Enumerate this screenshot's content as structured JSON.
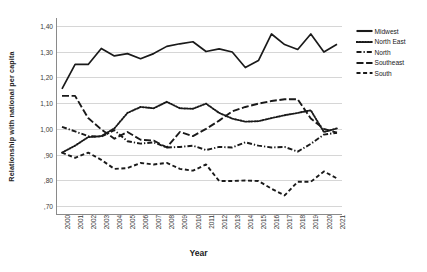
{
  "chart_data": {
    "type": "line",
    "title": "",
    "xlabel": "Year",
    "ylabel": "Relationship with national per capita",
    "grid": true,
    "legend_position": "right",
    "decimal_separator": ",",
    "x": [
      2000,
      2001,
      2002,
      2003,
      2004,
      2005,
      2006,
      2007,
      2008,
      2009,
      2010,
      2011,
      2012,
      2013,
      2014,
      2015,
      2016,
      2017,
      2018,
      2019,
      2020,
      2021
    ],
    "xtick_labels": [
      "2000",
      "2001",
      "2002",
      "2003",
      "2004",
      "2005",
      "2006",
      "2007",
      "2008",
      "2009",
      "2010",
      "2011",
      "2012",
      "2013",
      "2014",
      "2015",
      "2016",
      "2017",
      "2018",
      "2019",
      "2020",
      "2021"
    ],
    "ytick_labels": [
      "1,40",
      "1,30",
      "1,20",
      "1,10",
      "1,00",
      ",90",
      ",80",
      ",70"
    ],
    "ytick_values": [
      1.4,
      1.3,
      1.2,
      1.1,
      1.0,
      0.9,
      0.8,
      0.7
    ],
    "ylim": [
      0.67,
      1.43
    ],
    "series": [
      {
        "name": "Midwest",
        "style": "solid",
        "color": "#1a1a1a",
        "values": [
          1.155,
          1.25,
          1.25,
          1.312,
          1.283,
          1.292,
          1.272,
          1.292,
          1.32,
          1.33,
          1.338,
          1.3,
          1.31,
          1.298,
          1.238,
          1.265,
          1.368,
          1.327,
          1.308,
          1.368,
          1.298,
          1.328
        ]
      },
      {
        "name": "North East",
        "style": "dotted",
        "color": "#1a1a1a",
        "values": [
          0.908,
          0.935,
          0.968,
          0.972,
          1.002,
          1.062,
          1.085,
          1.08,
          1.105,
          1.08,
          1.078,
          1.098,
          1.062,
          1.04,
          1.028,
          1.03,
          1.042,
          1.053,
          1.062,
          1.072,
          0.988,
          1.002
        ]
      },
      {
        "name": "North",
        "style": "dashdot",
        "color": "#1a1a1a",
        "values": [
          1.008,
          0.99,
          0.972,
          0.97,
          0.995,
          0.952,
          0.943,
          0.948,
          0.928,
          0.93,
          0.935,
          0.918,
          0.93,
          0.928,
          0.948,
          0.935,
          0.928,
          0.93,
          0.912,
          0.942,
          0.978,
          0.985
        ]
      },
      {
        "name": "Southeast",
        "style": "longdash",
        "color": "#1a1a1a",
        "values": [
          1.128,
          1.128,
          1.042,
          0.998,
          0.962,
          0.988,
          0.958,
          0.955,
          0.928,
          0.988,
          0.972,
          1.0,
          1.032,
          1.068,
          1.085,
          1.098,
          1.108,
          1.115,
          1.115,
          1.04,
          1.0,
          0.985
        ]
      },
      {
        "name": "South",
        "style": "dash",
        "color": "#1a1a1a",
        "values": [
          0.908,
          0.888,
          0.908,
          0.88,
          0.845,
          0.848,
          0.868,
          0.862,
          0.868,
          0.845,
          0.838,
          0.862,
          0.798,
          0.798,
          0.8,
          0.798,
          0.768,
          0.742,
          0.795,
          0.795,
          0.835,
          0.808
        ]
      }
    ]
  },
  "legend": {
    "items": [
      {
        "label": "Midwest"
      },
      {
        "label": "North East"
      },
      {
        "label": "North"
      },
      {
        "label": "Southeast"
      },
      {
        "label": "South"
      }
    ]
  }
}
